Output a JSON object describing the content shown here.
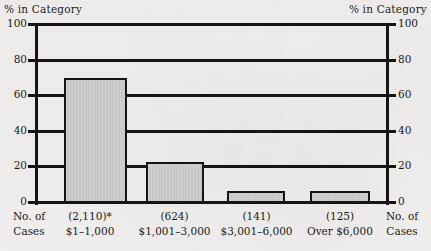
{
  "chart_data": {
    "type": "bar",
    "title": "",
    "subtitle": "",
    "ylabel_top_left": "% in Category",
    "ylabel_top_right": "% in Category",
    "xlabel_left": "No. of\nCases",
    "xlabel_right": "No. of\nCases",
    "xlabel_left_line1": "No. of",
    "xlabel_left_line2": "Cases",
    "xlabel_right_line1": "No. of",
    "xlabel_right_line2": "Cases",
    "categories": [
      "$1–1,000",
      "$1,001–3,000",
      "$3,001–6,000",
      "Over $6,000"
    ],
    "case_counts": [
      "(2,110)*",
      "(624)",
      "(141)",
      "(125)"
    ],
    "values": [
      70,
      23,
      7,
      7
    ],
    "ylim": [
      0,
      100
    ],
    "yticks": [
      0,
      20,
      40,
      60,
      80,
      100
    ],
    "ytick_labels_left": [
      "0",
      "20",
      "40",
      "60",
      "80",
      "100"
    ],
    "ytick_labels_right": [
      "0",
      "20",
      "40",
      "60",
      "80",
      "100"
    ],
    "grid": true,
    "legend": "none",
    "bar_fill_color": "#c6c6c6",
    "bar_edge_color": "#141414",
    "axis_color": "#151515",
    "background_color": "#f2f1ef",
    "annotations": [
      "*"
    ]
  },
  "bars": [
    {
      "count": "(2,110)*",
      "range": "$1–1,000",
      "value": 70
    },
    {
      "count": "(624)",
      "range": "$1,001–3,000",
      "value": 23
    },
    {
      "count": "(141)",
      "range": "$3,001–6,000",
      "value": 7
    },
    {
      "count": "(125)",
      "range": "Over $6,000",
      "value": 7
    }
  ]
}
